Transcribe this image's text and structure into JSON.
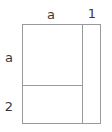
{
  "diagram": {
    "type": "area-model-rectangle",
    "top_labels": [
      {
        "text": "a",
        "x": 51,
        "y": 14
      },
      {
        "text": "1",
        "x": 92,
        "y": 13
      }
    ],
    "left_labels": [
      {
        "text": "a",
        "x": 9,
        "y": 57
      },
      {
        "text": "2",
        "x": 9,
        "y": 106
      }
    ],
    "colors": {
      "line": "#9a9a9a",
      "text": "#3a3a3a",
      "background": "#ffffff"
    }
  }
}
